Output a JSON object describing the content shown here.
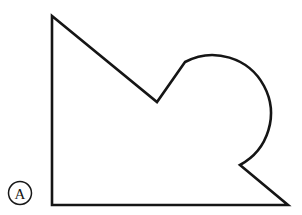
{
  "figure": {
    "label": "A",
    "label_style": "circled",
    "background_color": "#ffffff",
    "stroke_color": "#151515",
    "stroke_width": 2.6,
    "canvas": {
      "width": 302,
      "height": 215
    },
    "label_marker": {
      "center_x": 20,
      "center_y": 193,
      "radius": 11.5,
      "text": "A"
    },
    "shape": {
      "name": "closed-outline-with-circular-lobe",
      "description": "Closed outline: vertical left edge, long diagonal down-right to a V notch, a line up-right into a large circular arc lobe, arc sweeping clockwise to a re-entrant notch, then down-right to the bottom-right corner and back along the baseline.",
      "vertices": [
        {
          "name": "top-left-apex",
          "x": 52,
          "y": 16
        },
        {
          "name": "v-notch-vertex",
          "x": 157,
          "y": 102
        },
        {
          "name": "arc-start-tangent",
          "x": 185,
          "y": 62
        },
        {
          "name": "arc-top",
          "x": 220,
          "y": 53
        },
        {
          "name": "arc-right",
          "x": 276,
          "y": 110
        },
        {
          "name": "arc-end-notch-vertex",
          "x": 240,
          "y": 165
        },
        {
          "name": "bottom-right-corner",
          "x": 288,
          "y": 205
        },
        {
          "name": "bottom-left-corner",
          "x": 52,
          "y": 205
        }
      ],
      "arc": {
        "center_x": 220,
        "center_y": 110,
        "radius": 57,
        "sweep": "clockwise",
        "large_arc": true
      },
      "path_d": "M 52 16 L 52 205 L 288 205 L 240 165 A 57 57 0 1 0 185 62 L 157 102 Z"
    }
  }
}
